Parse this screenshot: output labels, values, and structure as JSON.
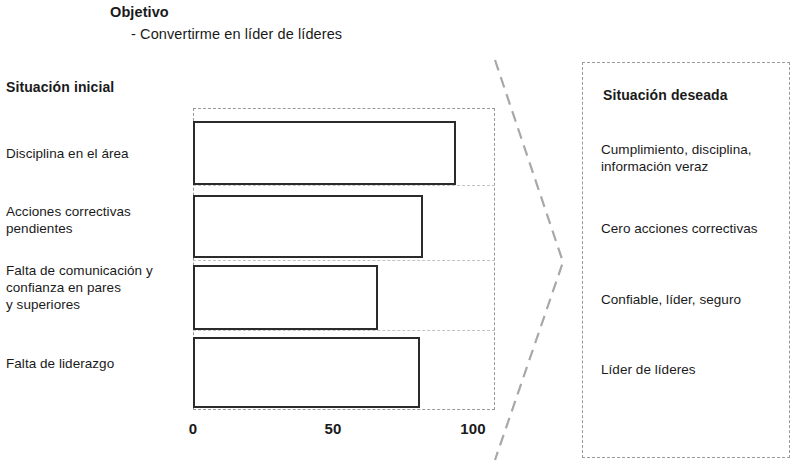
{
  "header": {
    "objective_title": "Objetivo",
    "objective_bullet": "- Convertirme en líder de líderes"
  },
  "left": {
    "heading": "Situación inicial",
    "labels": [
      "Disciplina en el área",
      "Acciones correctivas\npendientes",
      "Falta de comunicación y\nconfianza en pares\ny superiores",
      "Falta de liderazgo"
    ]
  },
  "right": {
    "heading": "Situación deseada",
    "items": [
      "Cumplimiento, disciplina,\ninformación veraz",
      "Cero acciones correctivas",
      "Confiable, líder, seguro",
      "Líder de líderes"
    ]
  },
  "axis": {
    "ticks": [
      "0",
      "50",
      "100"
    ]
  },
  "colors": {
    "bar_outline": "#2b2b2b",
    "bar_fill": "#ffffff",
    "frame_dash": "#9a9a9a",
    "grid_dash": "#c2c2c2",
    "text": "#1a1a1a",
    "background": "#ffffff"
  },
  "chart_data": {
    "type": "bar",
    "orientation": "horizontal",
    "title": "",
    "xlabel": "",
    "ylabel": "",
    "xlim": [
      0,
      108
    ],
    "grid": true,
    "legend": false,
    "categories": [
      "Disciplina en el área",
      "Acciones correctivas pendientes",
      "Falta de comunicación y confianza en pares y superiores",
      "Falta de liderazgo"
    ],
    "values": [
      94,
      82,
      66,
      81
    ],
    "tick_values": [
      0,
      50,
      100
    ],
    "tick_labels": [
      "0",
      "50",
      "100"
    ]
  }
}
